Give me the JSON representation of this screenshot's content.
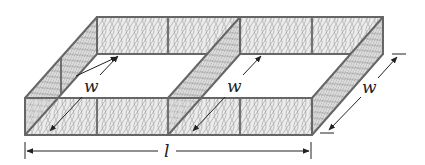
{
  "figure": {
    "labels": {
      "width_left": "w",
      "width_middle": "w",
      "width_right": "w",
      "length": "l"
    },
    "colors": {
      "frame": "#666666",
      "mesh": "#9a9a9a",
      "mesh_fill": "#e9e9e9",
      "dimension": "#222222",
      "background": "#ffffff"
    }
  }
}
